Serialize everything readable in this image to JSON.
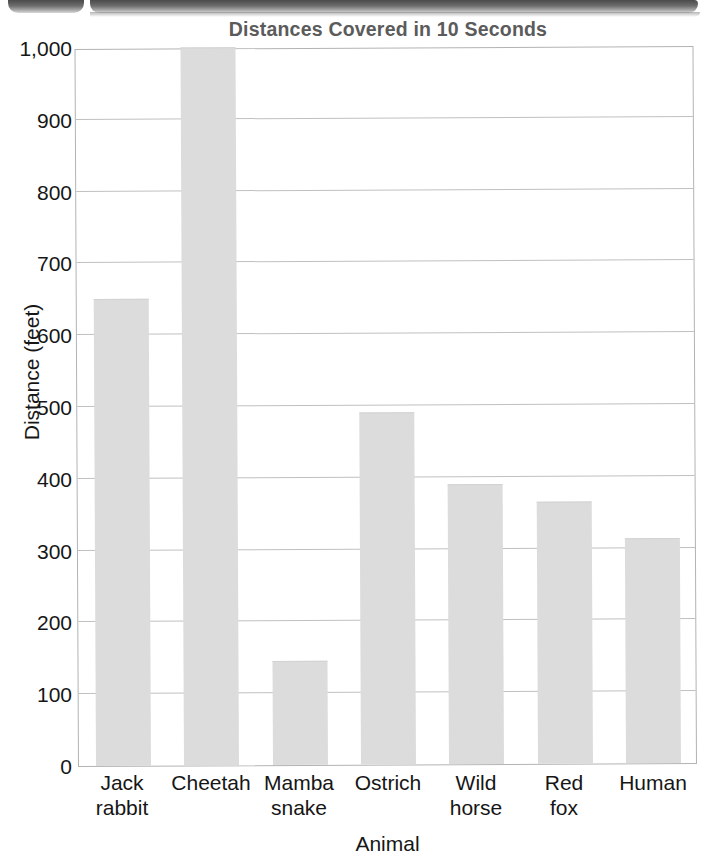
{
  "page": {
    "header_artifact": "scanned-page-header-bar"
  },
  "chart_data": {
    "type": "bar",
    "title": "Distances Covered in 10 Seconds",
    "xlabel": "Animal",
    "ylabel": "Distance (feet)",
    "categories": [
      "Jack rabbit",
      "Cheetah",
      "Mamba snake",
      "Ostrich",
      "Wild horse",
      "Red fox",
      "Human"
    ],
    "category_lines": [
      [
        "Jack",
        "rabbit"
      ],
      [
        "Cheetah",
        ""
      ],
      [
        "Mamba",
        "snake"
      ],
      [
        "Ostrich",
        ""
      ],
      [
        "Wild",
        "horse"
      ],
      [
        "Red",
        "fox"
      ],
      [
        "Human",
        ""
      ]
    ],
    "values": [
      650,
      1000,
      145,
      490,
      390,
      365,
      313
    ],
    "ylim": [
      0,
      1000
    ],
    "ytick_values": [
      0,
      100,
      200,
      300,
      400,
      500,
      600,
      700,
      800,
      900,
      1000
    ],
    "ytick_labels": [
      "0",
      "100",
      "200",
      "300",
      "400",
      "500",
      "600",
      "700",
      "800",
      "900",
      "1,000"
    ],
    "grid": true,
    "grid_axis": "y",
    "legend": null,
    "bar_color": "#dcdcdc",
    "grid_color": "#c0c0c0",
    "axis_color": "#b3b3b3",
    "title_color": "#5b5b5b",
    "text_color": "#161616"
  }
}
